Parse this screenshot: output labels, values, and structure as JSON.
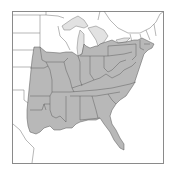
{
  "map": {
    "type": "species-range-map",
    "region": "Eastern United States",
    "colors": {
      "range_fill": "#b8b8b8",
      "lake_fill": "#e2e2e2",
      "background": "#ffffff",
      "frame": "#8a8a8a",
      "boundary": "#555555"
    },
    "range_states": [
      "Minnesota (southern)",
      "Iowa",
      "Missouri",
      "Arkansas",
      "Louisiana",
      "Texas (eastern)",
      "Oklahoma (eastern)",
      "Kansas (eastern)",
      "Wisconsin (southern)",
      "Illinois",
      "Indiana",
      "Michigan (southern)",
      "Ohio",
      "Kentucky",
      "Tennessee",
      "Mississippi",
      "Alabama",
      "Georgia",
      "Florida",
      "South Carolina",
      "North Carolina",
      "Virginia",
      "West Virginia",
      "Maryland",
      "Delaware",
      "New Jersey",
      "Pennsylvania",
      "New York",
      "Connecticut",
      "Rhode Island",
      "Massachusetts",
      "Vermont (southern)",
      "New Hampshire (southern)"
    ]
  }
}
